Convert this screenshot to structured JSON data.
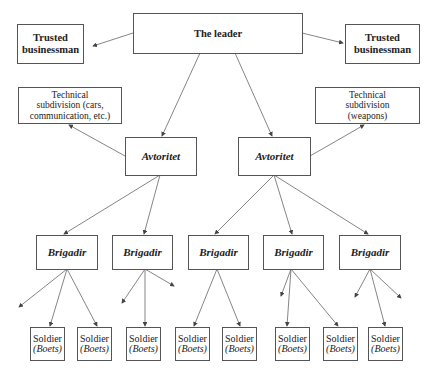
{
  "diagram": {
    "type": "organizational-hierarchy",
    "leader": {
      "label": "The leader"
    },
    "trusted_left": {
      "label_line1": "Trusted",
      "label_line2": "businessman"
    },
    "trusted_right": {
      "label_line1": "Trusted",
      "label_line2": "businessman"
    },
    "tech_left": {
      "line1": "Technical",
      "line2": "subdivision (cars,",
      "line3": "communication, etc.)"
    },
    "tech_right": {
      "line1": "Technical",
      "line2": "subdivision",
      "line3": "(weapons)"
    },
    "avtoritet": [
      {
        "label": "Avtoritet"
      },
      {
        "label": "Avtoritet"
      }
    ],
    "brigadir": [
      {
        "label": "Brigadir"
      },
      {
        "label": "Brigadir"
      },
      {
        "label": "Brigadir"
      },
      {
        "label": "Brigadir"
      },
      {
        "label": "Brigadir"
      }
    ],
    "soldiers": [
      {
        "label": "Soldier",
        "sub": "(Boets)"
      },
      {
        "label": "Soldier",
        "sub": "(Boets)"
      },
      {
        "label": "Soldier",
        "sub": "(Boets)"
      },
      {
        "label": "Soldier",
        "sub": "(Boets)"
      },
      {
        "label": "Soldier",
        "sub": "(Boets)"
      },
      {
        "label": "Soldier",
        "sub": "(Boets)"
      },
      {
        "label": "Soldier",
        "sub": "(Boets)"
      },
      {
        "label": "Soldier",
        "sub": "(Boets)"
      }
    ],
    "colors": {
      "line": "#555555",
      "text": "#222222",
      "background": "#ffffff"
    }
  }
}
